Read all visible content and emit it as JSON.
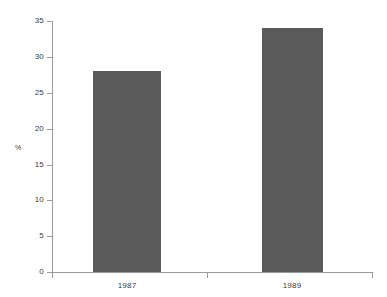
{
  "chart_data": {
    "type": "bar",
    "title": "",
    "subtitle": "",
    "xlabel": "",
    "ylabel": "%",
    "categories": [
      "1987",
      "1989"
    ],
    "values": [
      28,
      34
    ],
    "series": [
      {
        "name": "",
        "values": [
          28,
          34
        ]
      }
    ],
    "ylim": [
      0,
      35
    ],
    "ytick_labels": [
      "0",
      "5",
      "10",
      "15",
      "20",
      "25",
      "30",
      "35"
    ],
    "ytick_values": [
      0,
      5,
      10,
      15,
      20,
      25,
      30,
      35
    ],
    "grid": false,
    "legend": false,
    "legend_position": "none",
    "annotations": [],
    "colors": {
      "bar_fill": "#5a5a5a",
      "axis": "#9a9a9a",
      "text": "#3b3b3b",
      "background": "#ffffff"
    }
  }
}
